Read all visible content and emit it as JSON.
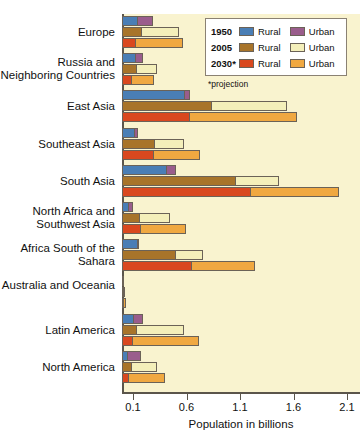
{
  "chart_data": {
    "type": "bar",
    "orientation": "horizontal",
    "title": "",
    "xlabel": "Population in billions",
    "ylabel": "",
    "xlim": [
      0,
      2.2
    ],
    "xticks": [
      0.1,
      0.6,
      1.1,
      1.6,
      2.1
    ],
    "xtick_labels": [
      "0.1",
      "0.6",
      "1.1",
      "1.6",
      "2.1"
    ],
    "grid": false,
    "legend_position": "top-right",
    "stacked": true,
    "categories": [
      "Europe",
      "Russia and Neighboring Countries",
      "East Asia",
      "Southeast Asia",
      "South Asia",
      "North Africa and Southwest Asia",
      "Africa South of the Sahara",
      "Australia and Oceania",
      "Latin America",
      "North America"
    ],
    "series": [
      {
        "name": "1950 Rural",
        "year": "1950",
        "type": "Rural",
        "color": "#4a7eb5",
        "values": [
          0.15,
          0.13,
          0.59,
          0.12,
          0.42,
          0.07,
          0.15,
          0.01,
          0.11,
          0.06
        ]
      },
      {
        "name": "1950 Urban",
        "year": "1950",
        "type": "Urban",
        "color": "#9a5d8c",
        "values": [
          0.29,
          0.2,
          0.64,
          0.15,
          0.5,
          0.1,
          0.16,
          0.02,
          0.2,
          0.18
        ]
      },
      {
        "name": "2005 Rural",
        "year": "2005",
        "type": "Rural",
        "color": "#a8742a",
        "values": [
          0.19,
          0.14,
          0.84,
          0.31,
          1.07,
          0.17,
          0.5,
          0.01,
          0.14,
          0.09
        ]
      },
      {
        "name": "2005 Urban",
        "year": "2005",
        "type": "Urban",
        "color": "#f4efba",
        "values": [
          0.53,
          0.33,
          1.54,
          0.58,
          1.47,
          0.45,
          0.76,
          0.03,
          0.58,
          0.33
        ]
      },
      {
        "name": "2030 Rural",
        "year": "2030",
        "type": "Rural",
        "color": "#d9481f",
        "values": [
          0.13,
          0.09,
          0.64,
          0.3,
          1.21,
          0.18,
          0.65,
          0.01,
          0.1,
          0.07
        ]
      },
      {
        "name": "2030 Urban",
        "year": "2030",
        "type": "Urban",
        "color": "#f0a841",
        "values": [
          0.57,
          0.3,
          1.64,
          0.73,
          2.03,
          0.6,
          1.24,
          0.04,
          0.72,
          0.4
        ]
      }
    ],
    "rows": [
      {
        "category": "Europe",
        "bars": [
          {
            "year": "1950",
            "rural": 0.15,
            "urban_total": 0.29
          },
          {
            "year": "2005",
            "rural": 0.19,
            "urban_total": 0.53
          },
          {
            "year": "2030",
            "rural": 0.13,
            "urban_total": 0.57
          }
        ]
      },
      {
        "category": "Russia and Neighboring Countries",
        "bars": [
          {
            "year": "1950",
            "rural": 0.13,
            "urban_total": 0.2
          },
          {
            "year": "2005",
            "rural": 0.14,
            "urban_total": 0.33
          },
          {
            "year": "2030",
            "rural": 0.09,
            "urban_total": 0.3
          }
        ]
      },
      {
        "category": "East Asia",
        "bars": [
          {
            "year": "1950",
            "rural": 0.59,
            "urban_total": 0.64
          },
          {
            "year": "2005",
            "rural": 0.84,
            "urban_total": 1.54
          },
          {
            "year": "2030",
            "rural": 0.64,
            "urban_total": 1.64
          }
        ]
      },
      {
        "category": "Southeast Asia",
        "bars": [
          {
            "year": "1950",
            "rural": 0.12,
            "urban_total": 0.15
          },
          {
            "year": "2005",
            "rural": 0.31,
            "urban_total": 0.58
          },
          {
            "year": "2030",
            "rural": 0.3,
            "urban_total": 0.73
          }
        ]
      },
      {
        "category": "South Asia",
        "bars": [
          {
            "year": "1950",
            "rural": 0.42,
            "urban_total": 0.5
          },
          {
            "year": "2005",
            "rural": 1.07,
            "urban_total": 1.47
          },
          {
            "year": "2030",
            "rural": 1.21,
            "urban_total": 2.03
          }
        ]
      },
      {
        "category": "North Africa and Southwest Asia",
        "bars": [
          {
            "year": "1950",
            "rural": 0.07,
            "urban_total": 0.1
          },
          {
            "year": "2005",
            "rural": 0.17,
            "urban_total": 0.45
          },
          {
            "year": "2030",
            "rural": 0.18,
            "urban_total": 0.6
          }
        ]
      },
      {
        "category": "Africa South of the Sahara",
        "bars": [
          {
            "year": "1950",
            "rural": 0.15,
            "urban_total": 0.16
          },
          {
            "year": "2005",
            "rural": 0.5,
            "urban_total": 0.76
          },
          {
            "year": "2030",
            "rural": 0.65,
            "urban_total": 1.24
          }
        ]
      },
      {
        "category": "Australia and Oceania",
        "bars": [
          {
            "year": "1950",
            "rural": 0.01,
            "urban_total": 0.02
          },
          {
            "year": "2005",
            "rural": 0.01,
            "urban_total": 0.03
          },
          {
            "year": "2030",
            "rural": 0.01,
            "urban_total": 0.04
          }
        ]
      },
      {
        "category": "Latin America",
        "bars": [
          {
            "year": "1950",
            "rural": 0.11,
            "urban_total": 0.2
          },
          {
            "year": "2005",
            "rural": 0.14,
            "urban_total": 0.58
          },
          {
            "year": "2030",
            "rural": 0.1,
            "urban_total": 0.72
          }
        ]
      },
      {
        "category": "North America",
        "bars": [
          {
            "year": "1950",
            "rural": 0.06,
            "urban_total": 0.18
          },
          {
            "year": "2005",
            "rural": 0.09,
            "urban_total": 0.33
          },
          {
            "year": "2030",
            "rural": 0.07,
            "urban_total": 0.4
          }
        ]
      }
    ]
  },
  "legend": {
    "rows": [
      {
        "year": "1950",
        "rural_label": "Rural",
        "urban_label": "Urban",
        "rural_color": "#4a7eb5",
        "urban_color": "#9a5d8c"
      },
      {
        "year": "2005",
        "rural_label": "Rural",
        "urban_label": "Urban",
        "rural_color": "#a8742a",
        "urban_color": "#f4efba"
      },
      {
        "year": "2030*",
        "rural_label": "Rural",
        "urban_label": "Urban",
        "rural_color": "#d9481f",
        "urban_color": "#f0a841"
      }
    ],
    "note": "*projection"
  },
  "colors": {
    "panel_background": "#f9f3cf",
    "axis": "#5b554b",
    "bar_outline": "#6b6257"
  }
}
